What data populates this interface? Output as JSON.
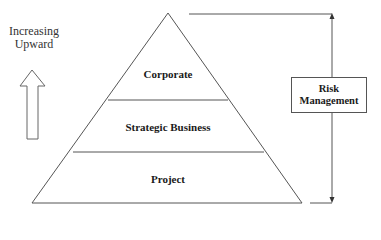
{
  "diagram": {
    "type": "pyramid",
    "side_label": {
      "line1": "Increasing",
      "line2": "Upward"
    },
    "levels": [
      {
        "label": "Corporate",
        "position": "top"
      },
      {
        "label": "Strategic Business",
        "position": "middle"
      },
      {
        "label": "Project",
        "position": "bottom"
      }
    ],
    "scope_box": {
      "line1": "Risk",
      "line2": "Management"
    },
    "colors": {
      "stroke": "#555555",
      "text": "#1a1a1a",
      "background": "#ffffff"
    }
  }
}
